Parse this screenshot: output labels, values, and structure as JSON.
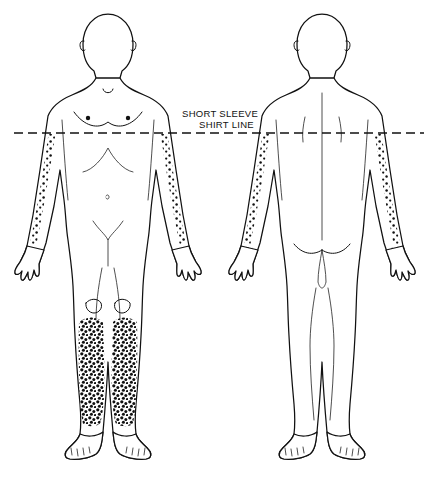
{
  "diagram": {
    "title_lines": [
      "SHORT SLEEVE",
      "SHIRT LINE"
    ],
    "shirt_label_line1": "SHORT SLEEVE",
    "shirt_label_line2": "SHIRT LINE",
    "colors": {
      "outline": "#111111",
      "background": "#ffffff",
      "stipple": "#111111"
    },
    "figures": [
      {
        "name": "anterior-figure",
        "view": "front",
        "affected_regions": [
          "left-lateral-arm-below-shirt-line",
          "right-lateral-arm-below-shirt-line",
          "left-lower-leg-shin",
          "right-lower-leg-shin"
        ],
        "clear_regions": [
          "head",
          "chest",
          "abdomen",
          "hands",
          "thighs",
          "feet"
        ]
      },
      {
        "name": "posterior-figure",
        "view": "back",
        "affected_regions": [
          "left-posterior-arm-below-shirt-line",
          "right-posterior-arm-below-shirt-line",
          "left-dorsal-hand",
          "right-dorsal-hand"
        ],
        "clear_regions": [
          "head",
          "back",
          "buttocks",
          "legs",
          "feet"
        ]
      }
    ],
    "markers": {
      "shirt_line_y": 133,
      "nipple_dots": 2,
      "navel": 1,
      "patella_outlines": 2
    }
  }
}
